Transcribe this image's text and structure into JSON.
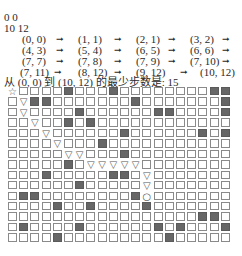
{
  "input": {
    "line1": "0 0",
    "line2": "10 12"
  },
  "path": {
    "arrow": "→",
    "rows": [
      [
        "(0, 0)",
        "(1, 1)",
        "(2, 1)",
        "(3, 2)"
      ],
      [
        "(4, 3)",
        "(5, 4)",
        "(6, 5)",
        "(6, 6)"
      ],
      [
        "(7, 7)",
        "(7, 8)",
        "(7, 9)",
        "(7, 10)"
      ],
      [
        "(7, 11)",
        "(8, 12)",
        "(9, 12)",
        "(10, 12)"
      ]
    ]
  },
  "summary": "从 (0, 0) 到 (10, 12) 的最少步数是: 15",
  "grid": {
    "rows": 15,
    "cols": 20,
    "legend": {
      "start": "☆",
      "path": "▽",
      "end": "○",
      "wall": "filled",
      "empty": "□"
    },
    "cells": [
      "S....#...#........##",
      ".P##.......#.......#",
      ".P....#......##....#",
      "..P..#.#............",
      "...P......#......#.#",
      "....P...#...........",
      ".....PP...#.........",
      ".....#.PPPPP........",
      "...#.....##.P.......",
      "......#.....P.......",
      ".##........#E.......",
      "....#..#....#.......",
      ".................##.",
      ".#....#......#.#...#",
      "....#.........#....."
    ]
  }
}
